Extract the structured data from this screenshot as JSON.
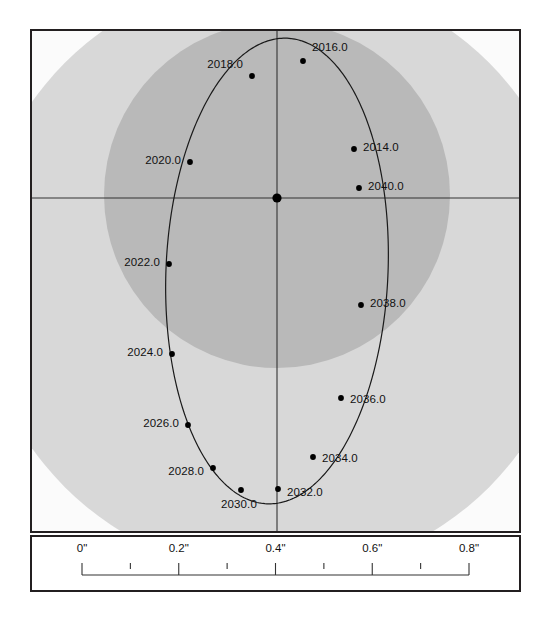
{
  "figure": {
    "kind": "binary-star-relative-orbit",
    "center_marker_name": "primary-star"
  },
  "chart_data": {
    "type": "scatter",
    "title": "",
    "xlabel": "",
    "ylabel": "",
    "x_unit": "arcsec",
    "grid": false,
    "legend": null,
    "axis_lines": {
      "horizontal_at_y": 0.0,
      "vertical_at_x": 0.0
    },
    "orbit_ellipse": {
      "center_x_px": 277,
      "center_y_px": 271,
      "semi_major_px": 233,
      "semi_minor_px": 111,
      "rotation_deg": 2.5
    },
    "primary_star": {
      "x_px": 277,
      "y_px": 198,
      "label": ""
    },
    "series": [
      {
        "name": "epoch markers",
        "points": [
          {
            "label": "2016.0",
            "x_px": 303,
            "y_px": 61,
            "label_dx": 9,
            "label_dy": -13,
            "label_anchor": "left"
          },
          {
            "label": "2018.0",
            "x_px": 252,
            "y_px": 76,
            "label_dx": -9,
            "label_dy": -11,
            "label_anchor": "right"
          },
          {
            "label": "2014.0",
            "x_px": 354,
            "y_px": 149,
            "label_dx": 9,
            "label_dy": -1,
            "label_anchor": "left"
          },
          {
            "label": "2020.0",
            "x_px": 190,
            "y_px": 162,
            "label_dx": -9,
            "label_dy": -1,
            "label_anchor": "right"
          },
          {
            "label": "2040.0",
            "x_px": 359,
            "y_px": 188,
            "label_dx": 9,
            "label_dy": -1,
            "label_anchor": "left"
          },
          {
            "label": "2022.0",
            "x_px": 169,
            "y_px": 264,
            "label_dx": -9,
            "label_dy": -1,
            "label_anchor": "right"
          },
          {
            "label": "2038.0",
            "x_px": 361,
            "y_px": 305,
            "label_dx": 9,
            "label_dy": -1,
            "label_anchor": "left"
          },
          {
            "label": "2024.0",
            "x_px": 172,
            "y_px": 354,
            "label_dx": -9,
            "label_dy": -1,
            "label_anchor": "right"
          },
          {
            "label": "2036.0",
            "x_px": 341,
            "y_px": 398,
            "label_dx": 9,
            "label_dy": 2,
            "label_anchor": "left"
          },
          {
            "label": "2026.0",
            "x_px": 188,
            "y_px": 425,
            "label_dx": -9,
            "label_dy": -1,
            "label_anchor": "right"
          },
          {
            "label": "2034.0",
            "x_px": 313,
            "y_px": 457,
            "label_dx": 9,
            "label_dy": 2,
            "label_anchor": "left"
          },
          {
            "label": "2028.0",
            "x_px": 213,
            "y_px": 468,
            "label_dx": -9,
            "label_dy": 4,
            "label_anchor": "right"
          },
          {
            "label": "2032.0",
            "x_px": 278,
            "y_px": 489,
            "label_dx": 9,
            "label_dy": 4,
            "label_anchor": "left"
          },
          {
            "label": "2030.0",
            "x_px": 241,
            "y_px": 490,
            "label_dx": -2,
            "label_dy": 15,
            "label_anchor": "center"
          }
        ]
      }
    ],
    "shading_regions": [
      {
        "name": "outer-halo",
        "center_x_px": 277,
        "center_y_px": 275,
        "radius_px": 300,
        "color": "#d8d8d8"
      },
      {
        "name": "inner-halo",
        "center_x_px": 277,
        "center_y_px": 195,
        "radius_px": 173,
        "color": "#b9b9b9"
      }
    ]
  },
  "scale_bar": {
    "unit_suffix": "\"",
    "ticks": [
      {
        "label": "0\"",
        "value": 0.0,
        "major": true
      },
      {
        "label": "",
        "value": 0.1,
        "major": false
      },
      {
        "label": "0.2\"",
        "value": 0.2,
        "major": true
      },
      {
        "label": "",
        "value": 0.3,
        "major": false
      },
      {
        "label": "0.4\"",
        "value": 0.4,
        "major": true
      },
      {
        "label": "",
        "value": 0.5,
        "major": false
      },
      {
        "label": "0.6\"",
        "value": 0.6,
        "major": true
      },
      {
        "label": "",
        "value": 0.7,
        "major": false
      },
      {
        "label": "0.8\"",
        "value": 0.8,
        "major": true
      }
    ],
    "min": 0.0,
    "max": 0.8
  },
  "colors": {
    "frame": "#231f20",
    "orbit_line": "#1a1a1a",
    "marker": "#000000",
    "axis_line": "#333333",
    "page_background": "#ffffff",
    "panel_background": "#fdfdfd",
    "halo_outer": "#d8d8d8",
    "halo_inner": "#b9b9b9",
    "text": "#111111"
  }
}
